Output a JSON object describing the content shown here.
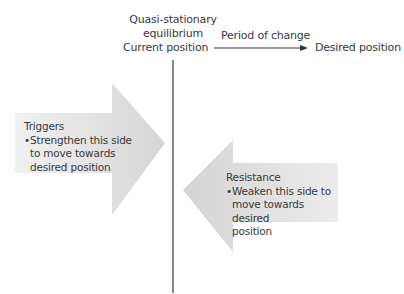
{
  "header": {
    "equilibrium_line1": "Quasi-stationary",
    "equilibrium_line2": "equilibrium",
    "current_position": "Current position",
    "period_of_change": "Period of change",
    "desired_position": "Desired position"
  },
  "triggers": {
    "title": "Triggers",
    "bullet_symbol": "•",
    "bullet_line1": "Strengthen this side",
    "bullet_line2": "to move towards",
    "bullet_line3": "desired position",
    "direction": "right"
  },
  "resistance": {
    "title": "Resistance",
    "bullet_symbol": "•",
    "bullet_line1": "Weaken this side to",
    "bullet_line2": "move towards desired",
    "bullet_line3": "position",
    "direction": "left"
  },
  "colors": {
    "arrow_fill_light": "#f2f2f2",
    "arrow_fill_dark": "#d9d9d9",
    "line": "#333333",
    "text": "#3a3a3a"
  }
}
